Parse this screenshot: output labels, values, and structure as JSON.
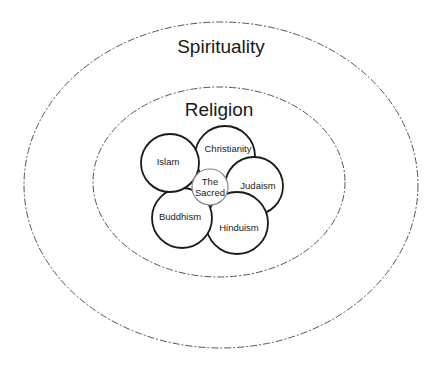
{
  "diagram": {
    "colors": {
      "background": "#ffffff",
      "stroke": "#1a1a1a",
      "dashed_stroke": "#555555",
      "sacred_stroke": "#888888",
      "text": "#1a1a1a"
    },
    "outer_ellipse": {
      "label": "Spirituality",
      "cx": 221,
      "cy": 185,
      "rx": 197,
      "ry": 163
    },
    "inner_ellipse": {
      "label": "Religion",
      "cx": 219,
      "cy": 182,
      "rx": 126,
      "ry": 95
    },
    "religions": [
      {
        "id": "christianity",
        "label": "Christianity",
        "cx": 225,
        "cy": 156,
        "r": 30
      },
      {
        "id": "judaism",
        "label": "Judaism",
        "cx": 254,
        "cy": 186,
        "r": 29
      },
      {
        "id": "hinduism",
        "label": "Hinduism",
        "cx": 237,
        "cy": 223,
        "r": 31
      },
      {
        "id": "buddhism",
        "label": "Buddhism",
        "cx": 182,
        "cy": 218,
        "r": 30
      },
      {
        "id": "islam",
        "label": "Islam",
        "cx": 170,
        "cy": 163,
        "r": 29
      }
    ],
    "center": {
      "label_line1": "The",
      "label_line2": "Sacred",
      "cx": 210,
      "cy": 187,
      "r": 18
    }
  }
}
